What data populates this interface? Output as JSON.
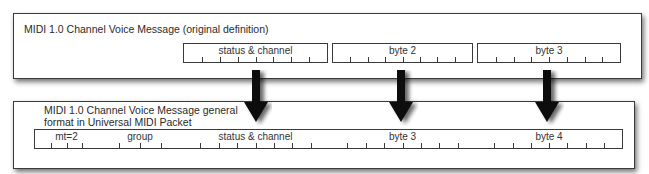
{
  "diagram": {
    "top_panel": {
      "title": "MIDI 1.0 Channel Voice Message (original definition)",
      "fields": [
        {
          "label": "status & channel",
          "bits": 8
        },
        {
          "label": "byte 2",
          "bits": 8
        },
        {
          "label": "byte 3",
          "bits": 8
        }
      ]
    },
    "bottom_panel": {
      "title_line1": "MIDI 1.0 Channel Voice Message general",
      "title_line2": "format in Universal MIDI Packet",
      "fields": [
        {
          "label": "mt=2",
          "bits": 4
        },
        {
          "label": "group",
          "bits": 4
        },
        {
          "label": "status & channel",
          "bits": 8
        },
        {
          "label": "byte 3",
          "bits": 8
        },
        {
          "label": "byte 4",
          "bits": 8
        }
      ]
    },
    "arrows": [
      {
        "from": "status & channel",
        "to": "status & channel"
      },
      {
        "from": "byte 2",
        "to": "byte 3"
      },
      {
        "from": "byte 3",
        "to": "byte 4"
      }
    ],
    "colors": {
      "border": "#3a3a3a",
      "arrow": "#111111",
      "text": "#2a2a2a",
      "background": "#ffffff"
    }
  }
}
